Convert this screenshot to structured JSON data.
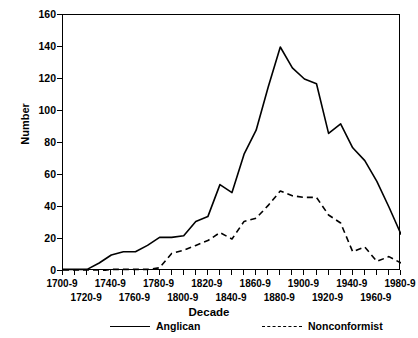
{
  "chart_data": {
    "type": "line",
    "title": "",
    "xlabel": "Decade",
    "ylabel": "Number",
    "ylim": [
      0,
      160
    ],
    "yticks": [
      0,
      20,
      40,
      60,
      80,
      100,
      120,
      140,
      160
    ],
    "grid": false,
    "legend_position": "bottom",
    "categories": [
      "1700-9",
      "1710-9",
      "1720-9",
      "1730-9",
      "1740-9",
      "1750-9",
      "1760-9",
      "1770-9",
      "1780-9",
      "1790-9",
      "1800-9",
      "1810-9",
      "1820-9",
      "1830-9",
      "1840-9",
      "1850-9",
      "1860-9",
      "1870-9",
      "1880-9",
      "1890-9",
      "1900-9",
      "1910-9",
      "1920-9",
      "1930-9",
      "1940-9",
      "1950-9",
      "1960-9",
      "1970-9",
      "1980-9"
    ],
    "xtick_labels_row_a": [
      "1700-9",
      "1740-9",
      "1780-9",
      "1820-9",
      "1860-9",
      "1900-9",
      "1940-9",
      "1980-9"
    ],
    "xtick_labels_row_b": [
      "1720-9",
      "1760-9",
      "1800-9",
      "1840-9",
      "1880-9",
      "1920-9",
      "1960-9"
    ],
    "series": [
      {
        "name": "Anglican",
        "style": "solid",
        "color": "#000000",
        "values": [
          1,
          1,
          1,
          5,
          10,
          12,
          12,
          16,
          21,
          21,
          22,
          31,
          34,
          54,
          49,
          73,
          88,
          115,
          140,
          127,
          120,
          117,
          86,
          92,
          77,
          69,
          56,
          40,
          23
        ]
      },
      {
        "name": "Nonconformist",
        "style": "dashed",
        "color": "#000000",
        "values": [
          0,
          0,
          0,
          0,
          1,
          1,
          1,
          1,
          2,
          11,
          13,
          16,
          19,
          24,
          20,
          31,
          33,
          41,
          50,
          47,
          46,
          46,
          35,
          30,
          12,
          15,
          6,
          9,
          5
        ]
      }
    ]
  },
  "legend": {
    "items": [
      {
        "label": "Anglican"
      },
      {
        "label": "Nonconformist"
      }
    ]
  }
}
